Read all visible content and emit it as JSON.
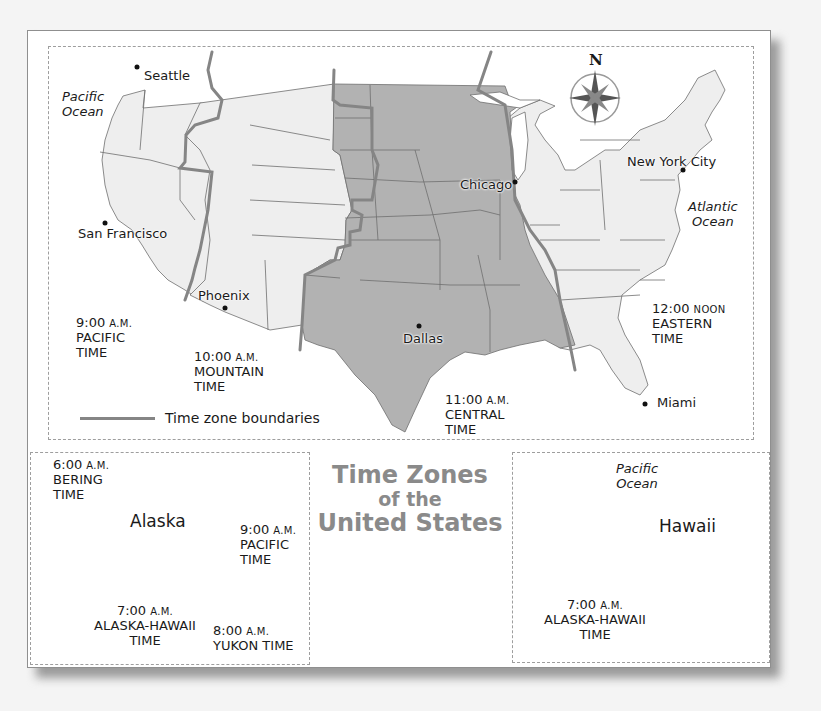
{
  "title": {
    "line1": "Time Zones",
    "line2": "of the",
    "line3": "United States"
  },
  "colors": {
    "central_zone_fill": "#b2b2b2",
    "other_zone_fill": "#eeeeee",
    "boundary_line": "#858585",
    "state_line": "#6e6e6e",
    "title_text": "#8a8a8a"
  },
  "compass": {
    "north_label": "N"
  },
  "legend": {
    "label": "Time zone boundaries",
    "icon": "gray-line-swatch"
  },
  "oceans": {
    "pacific": {
      "line1": "Pacific",
      "line2": "Ocean"
    },
    "atlantic": {
      "line1": "Atlantic",
      "line2": "Ocean"
    }
  },
  "cities": [
    {
      "name": "Seattle"
    },
    {
      "name": "San Francisco"
    },
    {
      "name": "Phoenix"
    },
    {
      "name": "Dallas"
    },
    {
      "name": "Chicago"
    },
    {
      "name": "New York City"
    },
    {
      "name": "Miami"
    }
  ],
  "zones": {
    "pacific": {
      "time": "9:00",
      "suffix": "A.M.",
      "name": "PACIFIC",
      "word": "TIME"
    },
    "mountain": {
      "time": "10:00",
      "suffix": "A.M.",
      "name": "MOUNTAIN",
      "word": "TIME"
    },
    "central": {
      "time": "11:00",
      "suffix": "A.M.",
      "name": "CENTRAL",
      "word": "TIME"
    },
    "eastern": {
      "time": "12:00",
      "suffix": "NOON",
      "name": "EASTERN",
      "word": "TIME"
    }
  },
  "alaska_inset": {
    "label": "Alaska",
    "zones": {
      "bering": {
        "time": "6:00",
        "suffix": "A.M.",
        "name": "BERING",
        "word": "TIME"
      },
      "alaska_hawaii": {
        "time": "7:00",
        "suffix": "A.M.",
        "name": "ALASKA-HAWAII",
        "word": "TIME"
      },
      "yukon": {
        "time": "8:00",
        "suffix": "A.M.",
        "name": "YUKON TIME"
      },
      "pacific": {
        "time": "9:00",
        "suffix": "A.M.",
        "name": "PACIFIC",
        "word": "TIME"
      }
    }
  },
  "hawaii_inset": {
    "label": "Hawaii",
    "ocean": {
      "line1": "Pacific",
      "line2": "Ocean"
    },
    "zone": {
      "time": "7:00",
      "suffix": "A.M.",
      "name": "ALASKA-HAWAII",
      "word": "TIME"
    }
  }
}
